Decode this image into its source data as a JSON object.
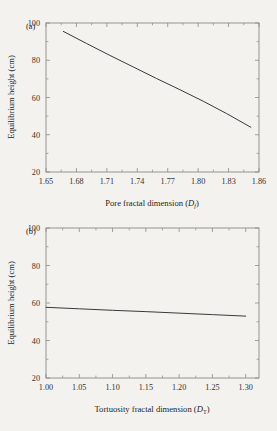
{
  "figure": {
    "background_color": "#f4f2ef",
    "line_color": "#3a3a3a",
    "axis_color": "#8a8a88"
  },
  "panel_a": {
    "tag": "(a)",
    "chart_data": {
      "type": "line",
      "title": "",
      "xlabel_text": "Pore fractal dimension (",
      "xlabel_symbol": "D",
      "xlabel_subscript": "f",
      "xlabel_close": ")",
      "ylabel": "Equilibrium height (cm)",
      "xlim": [
        1.65,
        1.86
      ],
      "ylim": [
        20,
        100
      ],
      "xticks": [
        1.65,
        1.68,
        1.71,
        1.74,
        1.77,
        1.8,
        1.83,
        1.86
      ],
      "xtick_labels": [
        "1.65",
        "1.68",
        "1.71",
        "1.74",
        "1.77",
        "1.80",
        "1.83",
        "1.86"
      ],
      "yticks": [
        20,
        40,
        60,
        80,
        100
      ],
      "ytick_labels": [
        "20",
        "40",
        "60",
        "80",
        "100"
      ],
      "x_minor_count": 1,
      "y_minor_count": 1,
      "grid": false,
      "legend": false,
      "series": [
        {
          "name": "Equilibrium height vs pore fractal dimension",
          "x": [
            1.667,
            1.69,
            1.713,
            1.736,
            1.759,
            1.782,
            1.805,
            1.828,
            1.852
          ],
          "y": [
            95.5,
            89.0,
            82.6,
            76.4,
            70.2,
            64.2,
            58.0,
            51.4,
            44.0
          ]
        }
      ]
    }
  },
  "panel_b": {
    "tag": "(b)",
    "chart_data": {
      "type": "line",
      "title": "",
      "xlabel_text": "Tortuosity fractal dimension (",
      "xlabel_symbol": "D",
      "xlabel_subscript": "T",
      "xlabel_close": ")",
      "ylabel": "Equilibrium height (cm)",
      "xlim": [
        1.0,
        1.32
      ],
      "ylim": [
        20,
        100
      ],
      "xticks": [
        1.0,
        1.05,
        1.1,
        1.15,
        1.2,
        1.25,
        1.3
      ],
      "xtick_labels": [
        "1.00",
        "1.05",
        "1.10",
        "1.15",
        "1.20",
        "1.25",
        "1.30"
      ],
      "yticks": [
        20,
        40,
        60,
        80,
        100
      ],
      "ytick_labels": [
        "20",
        "40",
        "60",
        "80",
        "100"
      ],
      "x_minor_count": 1,
      "y_minor_count": 1,
      "grid": false,
      "legend": false,
      "series": [
        {
          "name": "Equilibrium height vs tortuosity fractal dimension",
          "x": [
            1.0,
            1.05,
            1.1,
            1.15,
            1.2,
            1.25,
            1.3
          ],
          "y": [
            57.7,
            56.9,
            56.1,
            55.4,
            54.6,
            53.8,
            53.0
          ]
        }
      ]
    }
  }
}
